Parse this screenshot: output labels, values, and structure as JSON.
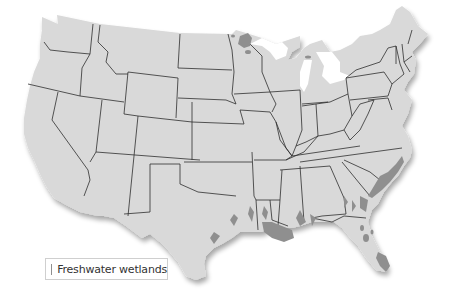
{
  "map": {
    "subject": "Contiguous United States",
    "land_color": "#d9d9d9",
    "border_color": "#2f2f2f",
    "wetland_color": "#8f8f8f",
    "background_color": "#ffffff"
  },
  "legend": {
    "items": [
      {
        "label": "Freshwater wetlands",
        "color": "#8f8f8f"
      }
    ]
  }
}
